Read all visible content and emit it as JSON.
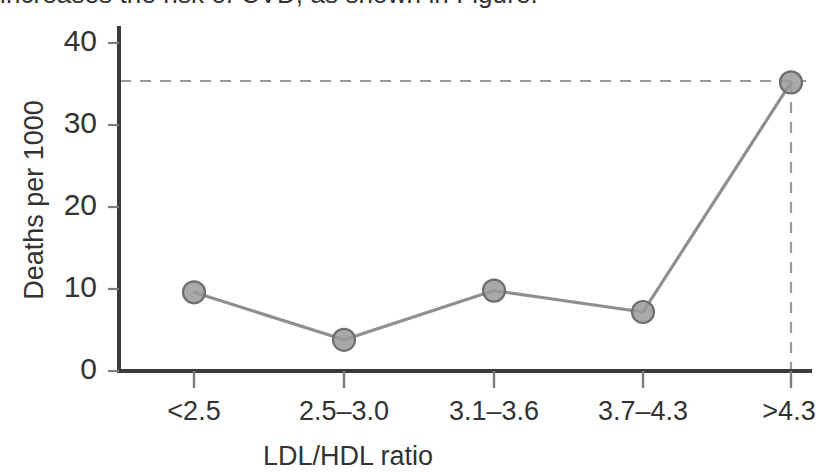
{
  "top_text": {
    "clipped_line": "increases the risk of CVD, as shown in Figure."
  },
  "colors": {
    "axis": "#3b3b3b",
    "line": "#8f8f8f",
    "marker_fill": "#9a9a9a",
    "marker_stroke": "#6e6e6e",
    "dashed": "#9a9a9a",
    "text": "#333333"
  },
  "chart_data": {
    "type": "line",
    "title": "",
    "xlabel": "LDL/HDL ratio",
    "ylabel": "Deaths per 1000",
    "categories": [
      "<2.5",
      "2.5–3.0",
      "3.1–3.6",
      "3.7–4.3",
      ">4.3"
    ],
    "values": [
      9.6,
      3.8,
      9.8,
      7.2,
      35.2
    ],
    "series": [
      {
        "name": "Deaths per 1000",
        "values": [
          9.6,
          3.8,
          9.8,
          7.2,
          35.2
        ]
      }
    ],
    "ylim": [
      0,
      42
    ],
    "yticks": [
      0,
      10,
      20,
      30,
      40
    ],
    "ytick_labels": [
      "0",
      "10",
      "20",
      "30",
      "40"
    ],
    "grid": false,
    "legend": null,
    "annotations": [
      {
        "kind": "horizontal-dashed-reference-line",
        "y": 35.2,
        "label": ""
      },
      {
        "kind": "vertical-dashed-reference-line",
        "x_category": ">4.3",
        "label": ""
      }
    ],
    "marker": "circle",
    "spines": [
      "left",
      "bottom"
    ]
  }
}
